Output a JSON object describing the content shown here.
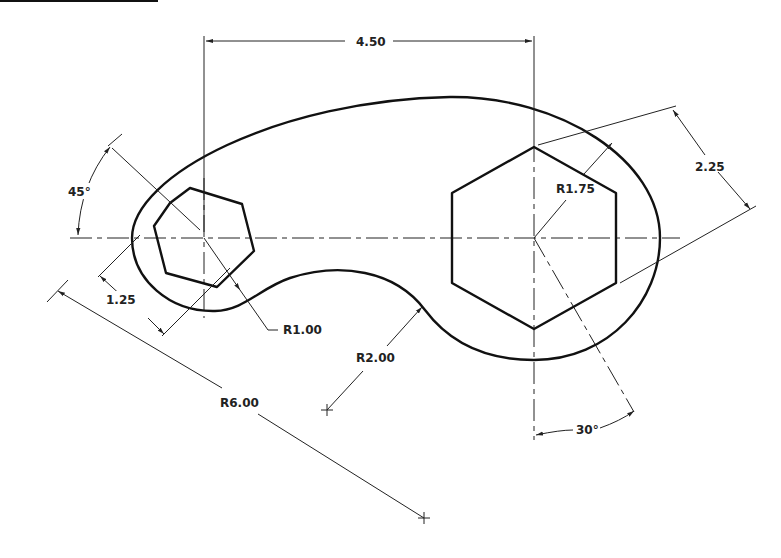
{
  "drawing": {
    "title_bar_label": "",
    "dimensions": {
      "center_distance": "4.50",
      "outer_offset": "2.25",
      "hex_radius": "R1.75",
      "left_angle": "45°",
      "left_offset": "1.25",
      "small_radius": "R1.00",
      "concave_radius": "R2.00",
      "large_radius": "R6.00",
      "right_angle": "30°"
    }
  },
  "colors": {
    "line": "#111111",
    "background": "#ffffff"
  }
}
